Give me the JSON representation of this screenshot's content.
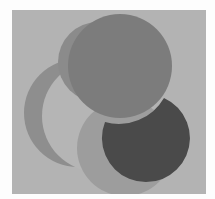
{
  "image": {
    "description": "Abstract composition of overlapping gray circles on a light gray square",
    "colors": {
      "page_background": "#fdfdfd",
      "panel": "#b3b3b3",
      "crescent_ring": "#8e8e8e",
      "crescent_hole": "#b5b5b5",
      "faded_circle": "#8b8b8b",
      "top_circle": "#7c7c7c",
      "middle_circle": "#999999",
      "dark_circle": "#4a4a4a"
    },
    "shapes": [
      {
        "name": "crescent-ring",
        "label": "left crescent"
      },
      {
        "name": "faded-circle",
        "label": "upper-left faded circle"
      },
      {
        "name": "top-circle",
        "label": "top large circle"
      },
      {
        "name": "middle-circle",
        "label": "lower middle circle"
      },
      {
        "name": "dark-circle",
        "label": "bottom-right dark circle"
      }
    ]
  }
}
